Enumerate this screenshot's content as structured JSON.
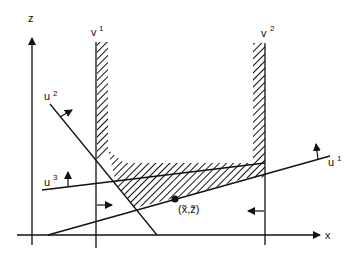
{
  "diagram": {
    "type": "geometric-constraint-diagram",
    "axes": {
      "x_label": "x",
      "z_label": "z"
    },
    "constraints": [
      {
        "id": "v1",
        "base": "v",
        "sup": "1",
        "kind": "vertical-boundary",
        "hatch_side": "right"
      },
      {
        "id": "v2",
        "base": "v",
        "sup": "2",
        "kind": "vertical-boundary",
        "hatch_side": "left"
      },
      {
        "id": "u1",
        "base": "u",
        "sup": "1",
        "kind": "line",
        "arrow": "up"
      },
      {
        "id": "u2",
        "base": "u",
        "sup": "2",
        "kind": "line",
        "arrow": "up-right"
      },
      {
        "id": "u3",
        "base": "u",
        "sup": "3",
        "kind": "line",
        "arrow": "up"
      }
    ],
    "point": {
      "label": "(x̄,z̄)",
      "label_display": "(x̃,z̃)"
    },
    "colors": {
      "ink": "#111111",
      "background": "#ffffff"
    }
  },
  "labels": {
    "z": "z",
    "x": "x",
    "v1": "v",
    "v1_sup": "1",
    "v2": "v",
    "v2_sup": "2",
    "u1": "u",
    "u1_sup": "1",
    "u2": "u",
    "u2_sup": "2",
    "u3": "u",
    "u3_sup": "3",
    "point": "(x̃,z̃)"
  }
}
